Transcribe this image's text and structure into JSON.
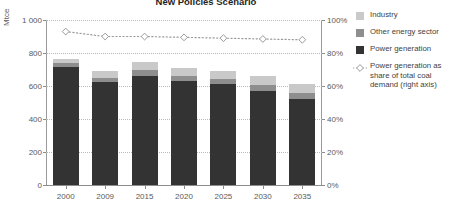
{
  "chart": {
    "title": "New Policies Scenario",
    "axis_left_title": "Mtce",
    "y_ticks": [
      "1 000",
      "800",
      "600",
      "400",
      "200",
      "0"
    ],
    "y2_ticks": [
      "100%",
      "80%",
      "60%",
      "40%",
      "20%",
      "0%"
    ]
  },
  "legend": {
    "items": [
      {
        "label": "Industry",
        "swatch": "industry-swatch",
        "color": "#c9c9c9"
      },
      {
        "label": "Other energy sector",
        "swatch": "other-energy-swatch",
        "color": "#8e8e8e"
      },
      {
        "label": "Power generation",
        "swatch": "power-generation-swatch",
        "color": "#333333"
      },
      {
        "label": "Power generation as share of total coal demand (right axis)",
        "swatch": "line-marker-swatch",
        "color": "#9a9a9a"
      }
    ]
  },
  "chart_data": {
    "type": "bar",
    "title": "New Policies Scenario",
    "xlabel": "",
    "ylabel": "Mtce",
    "y2label": "",
    "ylim": [
      0,
      1000
    ],
    "y2lim": [
      0,
      100
    ],
    "grid": true,
    "legend_position": "right",
    "stacked": true,
    "categories": [
      "2000",
      "2009",
      "2015",
      "2020",
      "2025",
      "2030",
      "2035"
    ],
    "series": [
      {
        "name": "Power generation",
        "axis": "left",
        "values": [
          715,
          622,
          660,
          630,
          610,
          570,
          520
        ]
      },
      {
        "name": "Other energy sector",
        "axis": "left",
        "values": [
          22,
          28,
          35,
          32,
          33,
          35,
          38
        ]
      },
      {
        "name": "Industry",
        "axis": "left",
        "values": [
          25,
          40,
          50,
          48,
          50,
          55,
          57
        ]
      }
    ],
    "line_series": [
      {
        "name": "Power generation as share of total coal demand (right axis)",
        "axis": "right",
        "unit": "%",
        "values": [
          93,
          90,
          90,
          89.5,
          89,
          88.5,
          88
        ]
      }
    ]
  }
}
